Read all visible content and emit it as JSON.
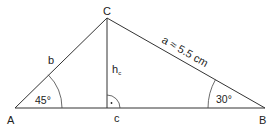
{
  "diagram": {
    "type": "triangle",
    "vertices": {
      "A": {
        "label": "A"
      },
      "B": {
        "label": "B"
      },
      "C": {
        "label": "C"
      }
    },
    "sides": {
      "a": {
        "label": "a ≈ 5.5 cm"
      },
      "b": {
        "label": "b"
      },
      "c": {
        "label": "c"
      }
    },
    "altitude": {
      "label": "h",
      "subscript": "c"
    },
    "angles": {
      "A": {
        "label": "45°"
      },
      "B": {
        "label": "30°"
      },
      "foot": {
        "label": "·",
        "type": "right-angle"
      }
    },
    "colors": {
      "stroke": "#333333",
      "text": "#222222",
      "background": "#ffffff"
    }
  }
}
